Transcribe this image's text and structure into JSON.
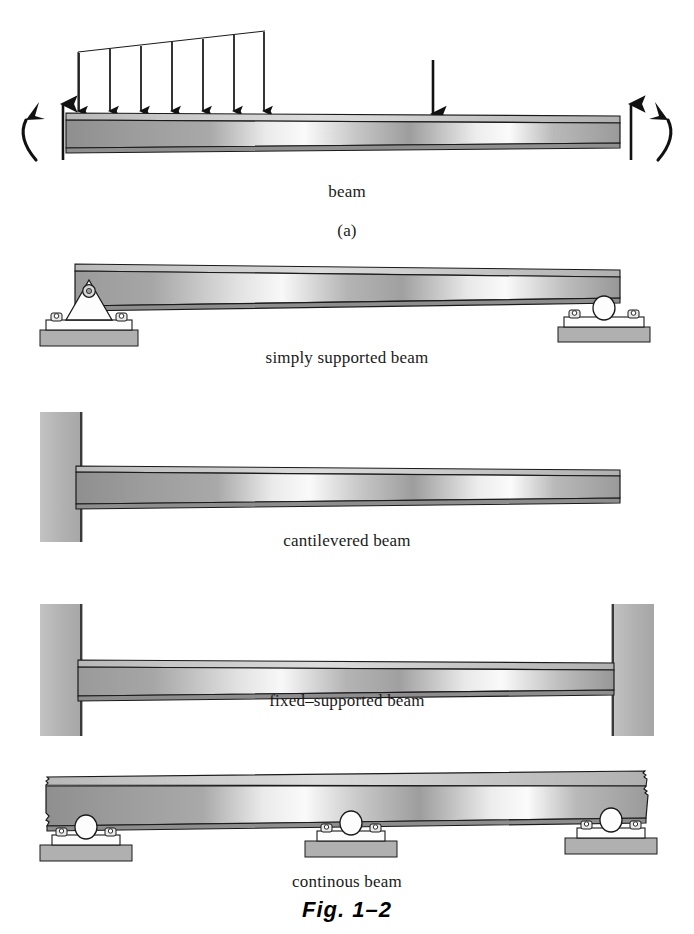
{
  "figure": {
    "caption": "Fig. 1–2",
    "subfigure_label": "(a)"
  },
  "colors": {
    "ink": "#111111",
    "beam_dark": "#8a8a8a",
    "beam_mid": "#a8a8a8",
    "beam_light": "#f2f2f2",
    "wall_gray": "#b5b5b5",
    "pad_gray": "#b0b0b0",
    "support_white": "#fdfdfd",
    "outline": "#1a1a1a"
  },
  "panels": [
    {
      "id": "loaded-beam",
      "label": "beam",
      "sub_label": "(a)",
      "loads": {
        "distributed_load": {
          "type": "trapezoidal-distributed-load",
          "arrow_count": 7,
          "x_start": 78,
          "x_end": 265,
          "tip_y": 112,
          "tail_y_left": 52,
          "tail_y_right": 31,
          "note": "linearly increasing left to right"
        },
        "concentrated_load": {
          "type": "point-load",
          "x": 433,
          "y_top": 60,
          "y_tip": 116
        },
        "reactions": [
          {
            "name": "left-vertical-reaction",
            "x": 63,
            "direction": "up"
          },
          {
            "name": "right-vertical-reaction",
            "x": 631,
            "direction": "up"
          }
        ],
        "moments": [
          {
            "name": "left-moment-couple",
            "x": 30,
            "direction": "counterclockwise"
          },
          {
            "name": "right-moment-couple",
            "x": 664,
            "direction": "clockwise"
          }
        ]
      }
    },
    {
      "id": "simply-supported-beam",
      "label": "simply supported beam",
      "supports": [
        "pin-support",
        "roller-support"
      ]
    },
    {
      "id": "cantilevered-beam",
      "label": "cantilevered beam",
      "supports": [
        "fixed-wall-support"
      ]
    },
    {
      "id": "fixed-supported-beam",
      "label": "fixed–supported beam",
      "supports": [
        "fixed-wall-support",
        "fixed-wall-support"
      ]
    },
    {
      "id": "continuous-beam",
      "label": "continous beam",
      "supports": [
        "roller-support",
        "roller-support",
        "roller-support"
      ],
      "ends": "broken / continuing"
    }
  ]
}
